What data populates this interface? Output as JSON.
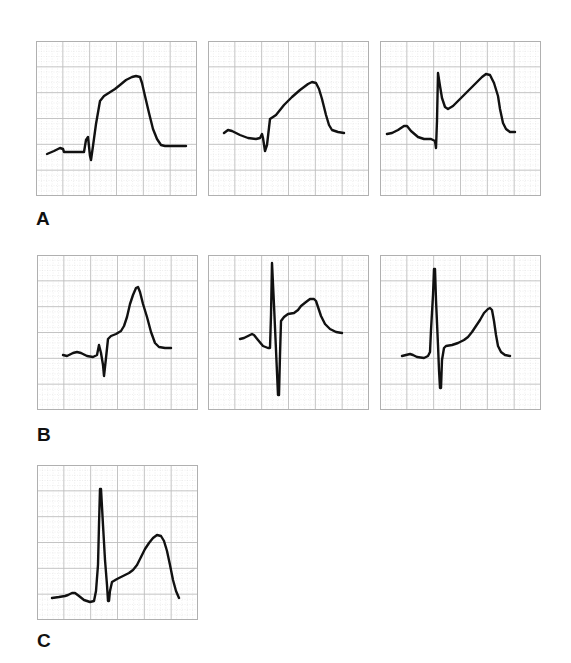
{
  "figure": {
    "grid": {
      "minor_color": "#e4e4e4",
      "major_color": "#bdbdbd",
      "border_color": "#b0b0b0",
      "trace_color": "#111111",
      "major_cols": 6,
      "major_rows": 6,
      "minor_per_major": 5
    },
    "groups": [
      {
        "label": "A",
        "panels": [
          {
            "id": "A1",
            "x": 36,
            "y": 41,
            "path": "M11,113 L18,110 L24,107 L27,108 L28,111 L46,111 L48,111 L50,99 L52,96 L54,115 L55,119 L57,105 L60,83 L64,60 L68,55 L79,48 L84,44 L90,39 L96,36 L100,35 L104,36 L106,42 L109,55 L113,72 L117,88 L121,98 L125,104 L129,105 L150,105"
          },
          {
            "id": "A2",
            "x": 208,
            "y": 41,
            "path": "M16,92 L20,89 L24,90 L32,94 L40,97 L48,98 L52,97 L54,93 L55,97 L57,110 L59,104 L62,78 L68,74 L76,64 L84,56 L92,49 L100,43 L104,41 L108,42 L111,48 L114,58 L118,74 L121,84 L124,89 L130,91 L136,92"
          },
          {
            "id": "A3",
            "x": 380,
            "y": 41,
            "path": "M7,93 L12,92 L18,89 L24,85 L27,85 L31,90 L38,96 L44,98 L51,98 L55,100 L56,107 L57,80 L58,32 L60,45 L62,57 L65,66 L68,68 L73,65 L80,58 L88,50 L96,42 L102,36 L106,33 L110,34 L114,42 L118,55 L120,68 L123,82 L126,88 L130,91 L135,91"
          }
        ],
        "label_pos": {
          "x": 36,
          "y": 209
        }
      },
      {
        "label": "B",
        "panels": [
          {
            "id": "B1",
            "x": 37,
            "y": 255,
            "path": "M26,100 L30,101 L36,98 L40,97 L44,98 L50,101 L56,102 L60,100 L62,90 L64,98 L66,110 L67,121 L69,103 L71,84 L74,81 L79,79 L84,76 L87,71 L90,62 L93,49 L96,40 L99,33 L101,32 L103,37 L106,49 L110,62 L114,77 L118,88 L122,92 L128,93 L134,93"
          },
          {
            "id": "B2",
            "x": 208,
            "y": 255,
            "path": "M32,84 L36,83 L40,81 L44,79 L46,80 L50,85 L55,91 L60,93 L62,93 L63,60 L64,8 L66,50 L68,95 L70,140 L71,140 L72,100 L73,66 L76,62 L80,59 L86,58 L90,55 L93,51 L98,47 L102,44 L106,44 L108,46 L110,52 L113,61 L117,69 L122,74 L128,77 L134,78"
          },
          {
            "id": "B3",
            "x": 380,
            "y": 255,
            "path": "M22,101 L26,100 L30,99 L33,100 L37,102 L44,103 L48,101 L50,97 L51,75 L53,40 L54,14 L55,14 L56,45 L58,90 L59,115 L60,133 L61,133 L62,105 L64,93 L66,91 L72,90 L78,88 L84,85 L88,82 L92,77 L96,71 L100,65 L104,58 L108,54 L110,53 L112,55 L114,66 L116,80 L118,91 L121,97 L125,100 L130,101"
          }
        ],
        "label_pos": {
          "x": 37,
          "y": 425
        }
      },
      {
        "label": "C",
        "panels": [
          {
            "id": "C1",
            "x": 37,
            "y": 465,
            "path": "M15,133 L22,132 L28,131 L31,130 L35,128 L38,128 L42,131 L47,135 L53,137 L57,136 L59,126 L61,100 L62,60 L63,24 L64,24 L66,60 L68,95 L70,120 L71,136 L72,136 L73,126 L75,117 L80,114 L86,111 L92,108 L96,105 L100,100 L104,92 L108,84 L112,78 L116,73 L120,70 L124,71 L127,76 L130,86 L133,100 L136,115 L139,126 L142,133"
          }
        ],
        "label_pos": {
          "x": 37,
          "y": 631
        }
      }
    ]
  }
}
